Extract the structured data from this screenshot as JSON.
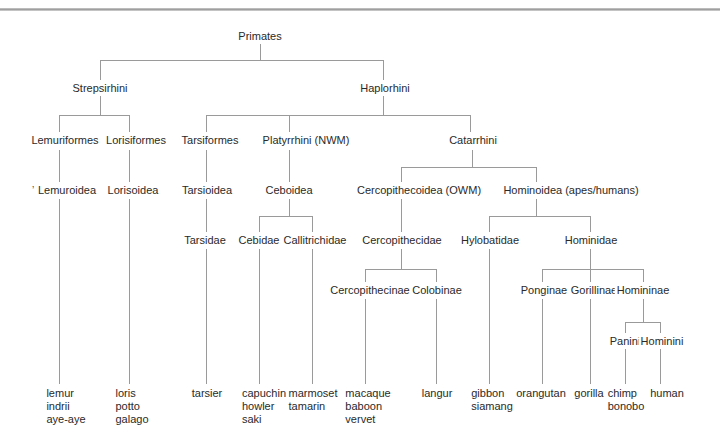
{
  "diagram": {
    "title": "Primates",
    "type": "cladogram",
    "line_color": "#9a9a9a",
    "text_color": "#2a2a2a"
  },
  "nodes": {
    "primates": "Primates",
    "strepsirhini": "Strepsirhini",
    "haplorhini": "Haplorhini",
    "lemuriformes": "Lemuriformes",
    "lorisiformes": "Lorisiformes",
    "tarsiformes": "Tarsiformes",
    "platyrrhini": "Platyrrhini (NWM)",
    "catarrhini": "Catarrhini",
    "lemuroidea": "Lemuroidea",
    "lorisoidea": "Lorisoidea",
    "tarsioidea": "Tarsioidea",
    "ceboidea": "Ceboidea",
    "cercopithecoidea": "Cercopithecoidea (OWM)",
    "hominoidea": "Hominoidea (apes/humans)",
    "tarsidae": "Tarsidae",
    "cebidae": "Cebidae",
    "callitrichidae": "Callitrichidae",
    "cercopithecidae": "Cercopithecidae",
    "hylobatidae": "Hylobatidae",
    "hominidae": "Hominidae",
    "cercopithecinae": "Cercopithecinae",
    "colobinae": "Colobinae",
    "ponginae": "Ponginae",
    "gorillinae": "Gorillinae",
    "homininae": "Homininae",
    "panini": "Panini",
    "hominini": "Hominini"
  },
  "leaves": {
    "lemuroidea": "lemur\nindrii\naye-aye",
    "lorisoidea": "loris\npotto\ngalago",
    "tarsidae": "tarsier",
    "cebidae": "capuchin\nhowler\nsaki",
    "callitrichidae": "marmoset\ntamarin",
    "cercopithecinae": "macaque\nbaboon\nvervet",
    "colobinae": "langur",
    "hylobatidae": "gibbon\nsiamang",
    "ponginae": "orangutan",
    "gorillinae": "gorilla",
    "panini": "chimp\nbonobo",
    "hominini": "human"
  },
  "stray_mark": "’"
}
